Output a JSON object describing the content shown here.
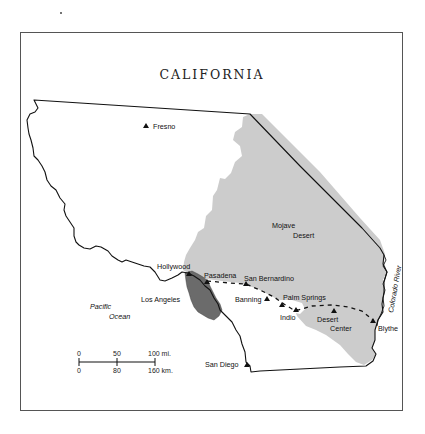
{
  "map": {
    "title": "CALIFORNIA",
    "colors": {
      "desert_fill": "#cccccc",
      "urban_fill": "#6b6b6b",
      "outline": "#111111",
      "frame": "#555555"
    },
    "cities": [
      {
        "name": "Fresno",
        "x": 147,
        "y": 128
      },
      {
        "name": "Hollywood",
        "x": 190,
        "y": 272
      },
      {
        "name": "Pasadena",
        "x": 207,
        "y": 281
      },
      {
        "name": "San Bernardino",
        "x": 246,
        "y": 281
      },
      {
        "name": "Los Angeles",
        "x": 0,
        "y": 0
      },
      {
        "name": "Banning",
        "x": 267,
        "y": 297
      },
      {
        "name": "Palm Springs",
        "x": 281,
        "y": 305
      },
      {
        "name": "Indio",
        "x": 295,
        "y": 312
      },
      {
        "name": "Desert Center",
        "x": 336,
        "y": 310
      },
      {
        "name": "Blythe",
        "x": 373,
        "y": 321
      },
      {
        "name": "San Diego",
        "x": 247,
        "y": 364
      }
    ],
    "labels": {
      "fresno": "Fresno",
      "hollywood": "Hollywood",
      "pasadena": "Pasadena",
      "san_bernardino": "San Bernardino",
      "los_angeles": "Los Angeles",
      "banning": "Banning",
      "palm_springs": "Palm Springs",
      "indio": "Indio",
      "desert_center_1": "Desert",
      "desert_center_2": "Center",
      "blythe": "Blythe",
      "san_diego": "San Diego",
      "mojave_1": "Mojave",
      "mojave_2": "Desert",
      "pacific_1": "Pacific",
      "pacific_2": "Ocean",
      "colorado_river": "Colorado River"
    },
    "scale_bar": {
      "miles": [
        "0",
        "50",
        "100 mi."
      ],
      "km": [
        "0",
        "80",
        "160 km."
      ]
    }
  }
}
